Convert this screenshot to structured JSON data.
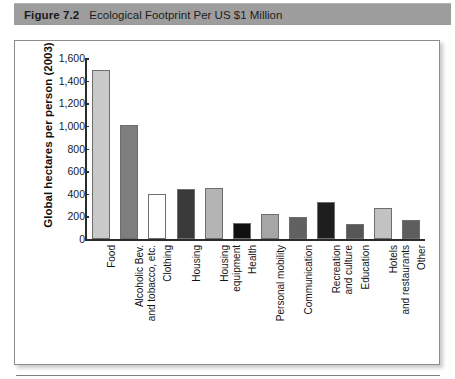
{
  "caption": {
    "label": "Figure 7.2",
    "title": "Ecological Footprint Per US $1 Million"
  },
  "chart_data": {
    "type": "bar",
    "title": "Ecological Footprint Per US $1 Million",
    "xlabel": "",
    "ylabel": "Global hectares per person (2003)",
    "ylim": [
      0,
      1600
    ],
    "ytick_values": [
      0,
      200,
      400,
      600,
      800,
      1000,
      1200,
      1400,
      1600
    ],
    "ytick_labels": [
      "0",
      "200",
      "400",
      "600",
      "800",
      "1,000",
      "1,200",
      "1,400",
      "1,600"
    ],
    "grid": false,
    "legend": "none",
    "categories": [
      "Food",
      "Alcoholic Bev. and tobacco, etc.",
      "Clothing",
      "Housing",
      "Housing equipment",
      "Health",
      "Personal mobility",
      "Communication",
      "Recreation and culture",
      "Education",
      "Hotels and restaurants",
      "Other"
    ],
    "category_lines": [
      [
        "Food",
        ""
      ],
      [
        "Alcoholic Bev.",
        "and tobacco, etc."
      ],
      [
        "Clothing",
        ""
      ],
      [
        "Housing",
        ""
      ],
      [
        "Housing",
        "equipment"
      ],
      [
        "Health",
        ""
      ],
      [
        "Personal mobility",
        ""
      ],
      [
        "Communication",
        ""
      ],
      [
        "Recreation",
        "and culture"
      ],
      [
        "Education",
        ""
      ],
      [
        "Hotels",
        "and restaurants"
      ],
      [
        "Other",
        ""
      ]
    ],
    "values": [
      1490,
      1010,
      400,
      440,
      450,
      140,
      225,
      195,
      330,
      130,
      275,
      170
    ],
    "bar_colors": [
      "#c9c9c9",
      "#7e7e7e",
      "#ffffff",
      "#3a3a3a",
      "#b4b4b4",
      "#101010",
      "#a6a6a6",
      "#616161",
      "#1e1e1e",
      "#565656",
      "#c2c2c2",
      "#5e5e5e"
    ]
  }
}
